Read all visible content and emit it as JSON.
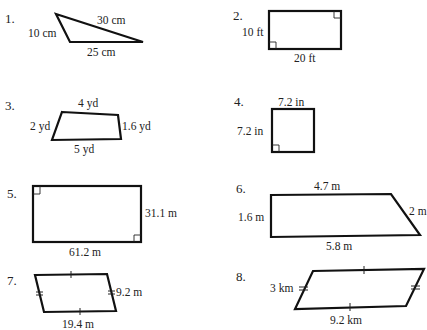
{
  "problems": [
    {
      "number": "1.",
      "shape": "triangle",
      "labels": {
        "left": "10 cm",
        "top": "30 cm",
        "bottom": "25 cm"
      }
    },
    {
      "number": "2.",
      "shape": "rectangle",
      "labels": {
        "left": "10 ft",
        "bottom": "20 ft"
      },
      "right_angle_marks": 2
    },
    {
      "number": "3.",
      "shape": "quadrilateral",
      "labels": {
        "top": "4 yd",
        "left": "2 yd",
        "right": "1.6 yd",
        "bottom": "5 yd"
      }
    },
    {
      "number": "4.",
      "shape": "square",
      "labels": {
        "top": "7.2 in",
        "left": "7.2 in"
      },
      "right_angle_marks": 1
    },
    {
      "number": "5.",
      "shape": "rectangle",
      "labels": {
        "right": "31.1 m",
        "bottom": "61.2 m"
      },
      "right_angle_marks": 2
    },
    {
      "number": "6.",
      "shape": "trapezoid",
      "labels": {
        "top": "4.7 m",
        "left": "1.6 m",
        "right": "2 m",
        "bottom": "5.8 m"
      }
    },
    {
      "number": "7.",
      "shape": "parallelogram",
      "labels": {
        "right": "9.2 m",
        "bottom": "19.4 m"
      },
      "tick_marks": {
        "top_bottom": 1,
        "sides": 2
      }
    },
    {
      "number": "8.",
      "shape": "parallelogram",
      "labels": {
        "left": "3 km",
        "bottom": "9.2 km"
      },
      "tick_marks": {
        "top_bottom": 1,
        "sides": 2
      }
    }
  ]
}
